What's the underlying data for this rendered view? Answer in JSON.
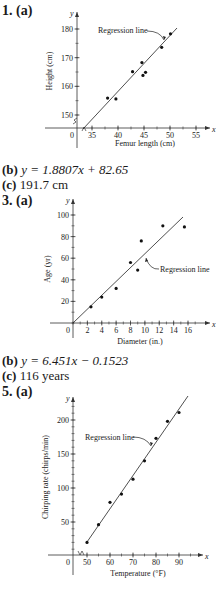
{
  "problems": [
    {
      "number": "1.",
      "part_a": "(a)",
      "part_b_label": "(b)",
      "part_b_text": "y = 1.8807x + 82.65",
      "part_c_label": "(c)",
      "part_c_text": "191.7 cm"
    },
    {
      "number": "3.",
      "part_a": "(a)",
      "part_b_label": "(b)",
      "part_b_text": "y = 6.451x − 0.1523",
      "part_c_label": "(c)",
      "part_c_text": "116 years"
    },
    {
      "number": "5.",
      "part_a": "(a)"
    }
  ],
  "chart_data": [
    {
      "type": "scatter",
      "title": "1. (a)",
      "xlabel": "Femur length (cm)",
      "ylabel": "Height (cm)",
      "x_axis_symbol": "x",
      "y_axis_symbol": "y",
      "origin_label": "0",
      "xticks": [
        35,
        40,
        45,
        50,
        55
      ],
      "yticks": [
        150,
        160,
        170,
        180
      ],
      "axis_break": true,
      "annotation": "Regression line",
      "points": [
        [
          38.0,
          155.9
        ],
        [
          39.6,
          155.6
        ],
        [
          42.8,
          165.1
        ],
        [
          44.6,
          168.3
        ],
        [
          44.8,
          163.8
        ],
        [
          45.3,
          164.9
        ],
        [
          48.4,
          173.6
        ],
        [
          50.1,
          178.3
        ]
      ],
      "regression": {
        "slope": 1.8807,
        "intercept": 82.65,
        "x_range": [
          32.5,
          51.5
        ]
      }
    },
    {
      "type": "scatter",
      "title": "3. (a)",
      "xlabel": "Diameter (in.)",
      "ylabel": "Age (yr)",
      "x_axis_symbol": "x",
      "y_axis_symbol": "y",
      "origin_label": "0",
      "xticks": [
        2,
        4,
        6,
        8,
        10,
        12,
        14,
        16
      ],
      "yticks": [
        20,
        40,
        60,
        80,
        100
      ],
      "axis_break": false,
      "annotation": "Regression line",
      "points": [
        [
          2.5,
          15
        ],
        [
          4,
          24
        ],
        [
          6,
          32
        ],
        [
          8,
          56
        ],
        [
          9,
          49
        ],
        [
          9.5,
          76
        ],
        [
          12.5,
          90
        ],
        [
          15.5,
          89
        ]
      ],
      "regression": {
        "slope": 6.451,
        "intercept": -0.1523,
        "x_range": [
          0,
          15.5
        ]
      }
    },
    {
      "type": "scatter",
      "title": "5. (a)",
      "xlabel": "Temperature (°F)",
      "ylabel": "Chirping rate (chirps/min)",
      "x_axis_symbol": "x",
      "y_axis_symbol": "y",
      "origin_label": "0",
      "xticks": [
        50,
        60,
        70,
        80,
        90
      ],
      "yticks": [
        50,
        100,
        150,
        200
      ],
      "axis_break": true,
      "annotation": "Regression line",
      "points": [
        [
          50,
          20
        ],
        [
          55,
          46
        ],
        [
          60,
          79
        ],
        [
          65,
          91
        ],
        [
          70,
          113
        ],
        [
          75,
          140
        ],
        [
          80,
          173
        ],
        [
          85,
          198
        ],
        [
          90,
          211
        ]
      ],
      "regression": {
        "slope": 4.4,
        "intercept": -202,
        "x_range": [
          50,
          93
        ]
      }
    }
  ]
}
